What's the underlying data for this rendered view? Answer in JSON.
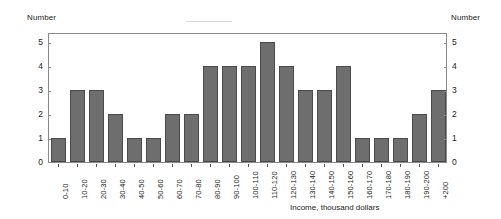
{
  "chart_data": {
    "type": "bar",
    "title": "",
    "xlabel": "Income, thousand dollars",
    "ylabel": "Number",
    "ylabel_right": "Number",
    "categories": [
      "0-10",
      "10-20",
      "20-30",
      "30-40",
      "40-50",
      "50-60",
      "60-70",
      "70-80",
      "80-90",
      "90-100",
      "100-110",
      "110-120",
      "120-130",
      "130-140",
      "140-150",
      "150-160",
      "160-170",
      "170-180",
      "180-190",
      "190-200",
      "+200"
    ],
    "values": [
      1,
      3,
      3,
      2,
      1,
      1,
      2,
      2,
      4,
      4,
      4,
      5,
      4,
      3,
      3,
      4,
      1,
      1,
      1,
      2,
      3
    ],
    "ylim": [
      0,
      5.4
    ],
    "yticks": [
      0,
      1,
      2,
      3,
      4,
      5
    ],
    "ytick_labels": [
      "0",
      "1",
      "2",
      "3",
      "4",
      "5"
    ],
    "grid": false,
    "legend": false,
    "bar_color": "#6e6e6e",
    "bar_edge_color": "#4a4a4a",
    "frame_color": "#8a8a8a"
  },
  "axes": {
    "left_title": "Number",
    "right_title": "Number",
    "x_title": "Income, thousand dollars"
  }
}
